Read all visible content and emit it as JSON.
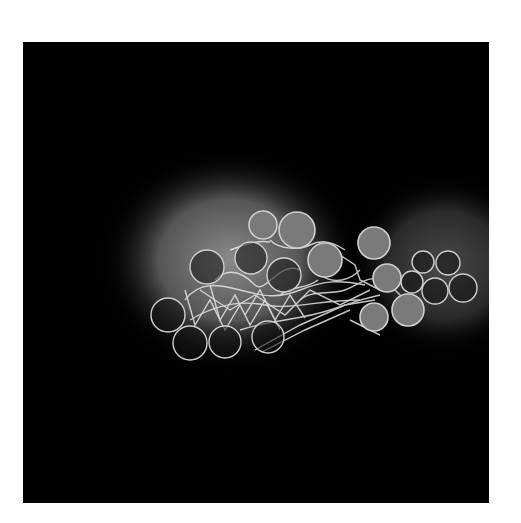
{
  "image": {
    "description": "Grayscale micrograph of a cluster of circular cells/droplets connected by a web of bright fibrous strands on a dark background with a soft glow",
    "background_color": "#000000",
    "frame": {
      "x": 23,
      "y": 42,
      "width": 466,
      "height": 461
    },
    "glows": [
      {
        "cx": 230,
        "cy": 260,
        "rx": 130,
        "ry": 110,
        "color": "#6e6e6e"
      },
      {
        "cx": 445,
        "cy": 265,
        "rx": 95,
        "ry": 90,
        "color": "#3a3a3a"
      }
    ],
    "filled_circles": [
      {
        "cx": 263,
        "cy": 225,
        "r": 14
      },
      {
        "cx": 297,
        "cy": 230,
        "r": 18
      },
      {
        "cx": 325,
        "cy": 260,
        "r": 17
      },
      {
        "cx": 374,
        "cy": 243,
        "r": 16
      },
      {
        "cx": 387,
        "cy": 278,
        "r": 14
      },
      {
        "cx": 374,
        "cy": 317,
        "r": 14
      },
      {
        "cx": 408,
        "cy": 310,
        "r": 16
      }
    ],
    "open_circles": [
      {
        "cx": 207,
        "cy": 267,
        "r": 17
      },
      {
        "cx": 251,
        "cy": 258,
        "r": 16
      },
      {
        "cx": 284,
        "cy": 275,
        "r": 17
      },
      {
        "cx": 168,
        "cy": 315,
        "r": 17
      },
      {
        "cx": 190,
        "cy": 343,
        "r": 17
      },
      {
        "cx": 225,
        "cy": 342,
        "r": 16
      },
      {
        "cx": 268,
        "cy": 337,
        "r": 16
      },
      {
        "cx": 423,
        "cy": 262,
        "r": 11
      },
      {
        "cx": 448,
        "cy": 263,
        "r": 12
      },
      {
        "cx": 412,
        "cy": 282,
        "r": 11
      },
      {
        "cx": 435,
        "cy": 291,
        "r": 13
      },
      {
        "cx": 463,
        "cy": 288,
        "r": 14
      }
    ],
    "colors": {
      "circle_fill": "#7a7a7a",
      "circle_stroke": "#cfcfcf",
      "strand": "#e6e6e6"
    }
  }
}
